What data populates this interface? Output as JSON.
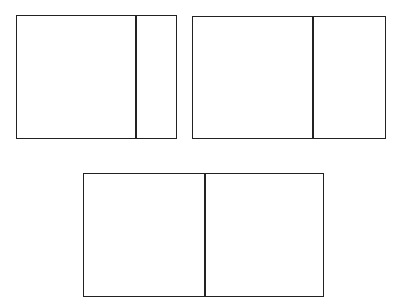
{
  "diagram": {
    "stroke_color": "#222222",
    "background": "#ffffff",
    "rectangles": [
      {
        "name": "top-left",
        "x": 16,
        "y": 15,
        "width": 161,
        "height": 124,
        "divider_x": 118
      },
      {
        "name": "top-right",
        "x": 192,
        "y": 16,
        "width": 194,
        "height": 123,
        "divider_x": 119
      },
      {
        "name": "bottom-center",
        "x": 83,
        "y": 173,
        "width": 241,
        "height": 124,
        "divider_x": 120
      }
    ]
  }
}
